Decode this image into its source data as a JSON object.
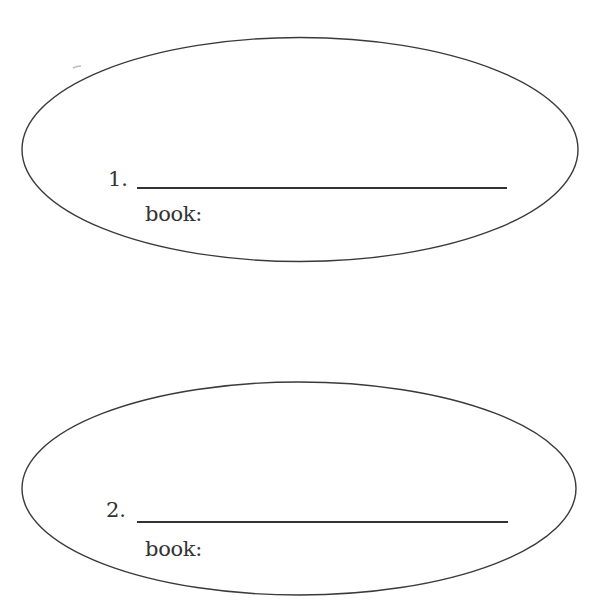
{
  "worksheet": {
    "items": [
      {
        "number_label": "1.",
        "answer_value": "",
        "book_label": "book:",
        "book_value": ""
      },
      {
        "number_label": "2.",
        "answer_value": "",
        "book_label": "book:",
        "book_value": ""
      }
    ]
  },
  "colors": {
    "stroke": "#3a3a3a",
    "text": "#333333",
    "background": "#ffffff"
  }
}
